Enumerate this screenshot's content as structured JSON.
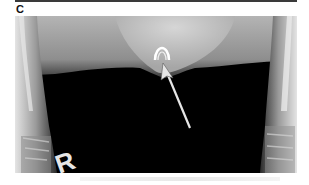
{
  "figure": {
    "panel_label": "C",
    "image_type": "radiograph",
    "side_marker": "R",
    "annotations": [
      {
        "type": "arrow",
        "description": "white arrow pointing to radiopaque object at soft-tissue margin",
        "tail": [
          190,
          128
        ],
        "head": [
          163,
          60
        ]
      }
    ],
    "colors": {
      "background": "#ffffff",
      "film_dark": "#000000",
      "soft_tissue": "#a8a8a8",
      "bone": "#d8d8d8",
      "arrow": "#e6e6e6"
    }
  }
}
